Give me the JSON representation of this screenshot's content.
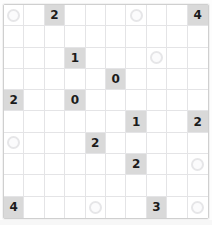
{
  "puzzle": {
    "type": "number-grid-puzzle",
    "rows": 10,
    "columns": 10,
    "colors": {
      "page_background": "#fdfdfd",
      "grid_background": "#ffffff",
      "grid_line": "#e4e4e6",
      "grid_border": "#cfcfcf",
      "clue_cell_background": "#d9d9d9",
      "clue_text": "#1b1b1b",
      "circle_marker_border": "#e6e6e8",
      "circle_marker_fill": "#fbfbfc"
    },
    "legend": {
      "clue_cell": "shaded cell containing a bold number clue",
      "circle_marker": "light gray open circle placed in a cell"
    },
    "cells": [
      [
        {
          "kind": "circle",
          "value": ""
        },
        {
          "kind": "empty",
          "value": ""
        },
        {
          "kind": "clue",
          "value": "2"
        },
        {
          "kind": "empty",
          "value": ""
        },
        {
          "kind": "empty",
          "value": ""
        },
        {
          "kind": "empty",
          "value": ""
        },
        {
          "kind": "circle",
          "value": ""
        },
        {
          "kind": "empty",
          "value": ""
        },
        {
          "kind": "empty",
          "value": ""
        },
        {
          "kind": "clue",
          "value": "4"
        }
      ],
      [
        {
          "kind": "empty",
          "value": ""
        },
        {
          "kind": "empty",
          "value": ""
        },
        {
          "kind": "empty",
          "value": ""
        },
        {
          "kind": "empty",
          "value": ""
        },
        {
          "kind": "empty",
          "value": ""
        },
        {
          "kind": "empty",
          "value": ""
        },
        {
          "kind": "empty",
          "value": ""
        },
        {
          "kind": "empty",
          "value": ""
        },
        {
          "kind": "empty",
          "value": ""
        },
        {
          "kind": "empty",
          "value": ""
        }
      ],
      [
        {
          "kind": "empty",
          "value": ""
        },
        {
          "kind": "empty",
          "value": ""
        },
        {
          "kind": "empty",
          "value": ""
        },
        {
          "kind": "clue",
          "value": "1"
        },
        {
          "kind": "empty",
          "value": ""
        },
        {
          "kind": "empty",
          "value": ""
        },
        {
          "kind": "empty",
          "value": ""
        },
        {
          "kind": "circle",
          "value": ""
        },
        {
          "kind": "empty",
          "value": ""
        },
        {
          "kind": "empty",
          "value": ""
        }
      ],
      [
        {
          "kind": "empty",
          "value": ""
        },
        {
          "kind": "empty",
          "value": ""
        },
        {
          "kind": "empty",
          "value": ""
        },
        {
          "kind": "empty",
          "value": ""
        },
        {
          "kind": "empty",
          "value": ""
        },
        {
          "kind": "clue",
          "value": "0"
        },
        {
          "kind": "empty",
          "value": ""
        },
        {
          "kind": "empty",
          "value": ""
        },
        {
          "kind": "empty",
          "value": ""
        },
        {
          "kind": "empty",
          "value": ""
        }
      ],
      [
        {
          "kind": "clue",
          "value": "2"
        },
        {
          "kind": "empty",
          "value": ""
        },
        {
          "kind": "empty",
          "value": ""
        },
        {
          "kind": "clue",
          "value": "0"
        },
        {
          "kind": "empty",
          "value": ""
        },
        {
          "kind": "empty",
          "value": ""
        },
        {
          "kind": "empty",
          "value": ""
        },
        {
          "kind": "empty",
          "value": ""
        },
        {
          "kind": "empty",
          "value": ""
        },
        {
          "kind": "empty",
          "value": ""
        }
      ],
      [
        {
          "kind": "empty",
          "value": ""
        },
        {
          "kind": "empty",
          "value": ""
        },
        {
          "kind": "empty",
          "value": ""
        },
        {
          "kind": "empty",
          "value": ""
        },
        {
          "kind": "empty",
          "value": ""
        },
        {
          "kind": "empty",
          "value": ""
        },
        {
          "kind": "clue",
          "value": "1"
        },
        {
          "kind": "empty",
          "value": ""
        },
        {
          "kind": "empty",
          "value": ""
        },
        {
          "kind": "clue",
          "value": "2"
        }
      ],
      [
        {
          "kind": "circle",
          "value": ""
        },
        {
          "kind": "empty",
          "value": ""
        },
        {
          "kind": "empty",
          "value": ""
        },
        {
          "kind": "empty",
          "value": ""
        },
        {
          "kind": "clue",
          "value": "2"
        },
        {
          "kind": "empty",
          "value": ""
        },
        {
          "kind": "empty",
          "value": ""
        },
        {
          "kind": "empty",
          "value": ""
        },
        {
          "kind": "empty",
          "value": ""
        },
        {
          "kind": "empty",
          "value": ""
        }
      ],
      [
        {
          "kind": "empty",
          "value": ""
        },
        {
          "kind": "empty",
          "value": ""
        },
        {
          "kind": "empty",
          "value": ""
        },
        {
          "kind": "empty",
          "value": ""
        },
        {
          "kind": "empty",
          "value": ""
        },
        {
          "kind": "empty",
          "value": ""
        },
        {
          "kind": "clue",
          "value": "2"
        },
        {
          "kind": "empty",
          "value": ""
        },
        {
          "kind": "empty",
          "value": ""
        },
        {
          "kind": "circle",
          "value": ""
        }
      ],
      [
        {
          "kind": "empty",
          "value": ""
        },
        {
          "kind": "empty",
          "value": ""
        },
        {
          "kind": "empty",
          "value": ""
        },
        {
          "kind": "empty",
          "value": ""
        },
        {
          "kind": "empty",
          "value": ""
        },
        {
          "kind": "empty",
          "value": ""
        },
        {
          "kind": "empty",
          "value": ""
        },
        {
          "kind": "empty",
          "value": ""
        },
        {
          "kind": "empty",
          "value": ""
        },
        {
          "kind": "empty",
          "value": ""
        }
      ],
      [
        {
          "kind": "clue",
          "value": "4"
        },
        {
          "kind": "empty",
          "value": ""
        },
        {
          "kind": "empty",
          "value": ""
        },
        {
          "kind": "empty",
          "value": ""
        },
        {
          "kind": "circle",
          "value": ""
        },
        {
          "kind": "empty",
          "value": ""
        },
        {
          "kind": "empty",
          "value": ""
        },
        {
          "kind": "clue",
          "value": "3"
        },
        {
          "kind": "empty",
          "value": ""
        },
        {
          "kind": "circle",
          "value": ""
        }
      ]
    ]
  }
}
